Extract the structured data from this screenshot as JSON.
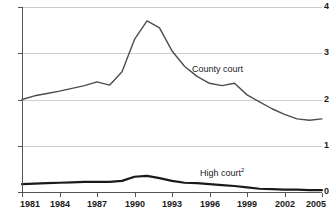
{
  "chart_data": {
    "type": "line",
    "title": "",
    "subtitle": "",
    "xlabel": "",
    "ylabel": "",
    "xlim": [
      1981,
      2005
    ],
    "ylim": [
      0,
      4
    ],
    "grid": true,
    "legend_position": "inline-annotation",
    "y_ticks": [
      0,
      1,
      2,
      3,
      4
    ],
    "y_tick_labels": [
      "0",
      "1",
      "2",
      "3",
      "4"
    ],
    "x_ticks": [
      1981,
      1984,
      1987,
      1990,
      1993,
      1996,
      1999,
      2002,
      2005
    ],
    "x_tick_labels": [
      "1981",
      "1984",
      "1987",
      "1990",
      "1993",
      "1996",
      "1999",
      "2002",
      "2005"
    ],
    "x": [
      1981,
      1982,
      1983,
      1984,
      1985,
      1986,
      1987,
      1988,
      1989,
      1990,
      1991,
      1992,
      1993,
      1994,
      1995,
      1996,
      1997,
      1998,
      1999,
      2000,
      2001,
      2002,
      2003,
      2004,
      2005
    ],
    "series": [
      {
        "name": "County court",
        "label": "County court",
        "color": "#4d4d4d",
        "line_width": 1.4,
        "values": [
          2.0,
          2.08,
          2.13,
          2.18,
          2.24,
          2.3,
          2.38,
          2.31,
          2.6,
          3.3,
          3.7,
          3.55,
          3.05,
          2.72,
          2.5,
          2.35,
          2.3,
          2.35,
          2.1,
          1.95,
          1.8,
          1.68,
          1.58,
          1.55,
          1.58
        ]
      },
      {
        "name": "High court",
        "label": "High court",
        "label_superscript": "2",
        "color": "#1a1a1a",
        "line_width": 2.2,
        "values": [
          0.17,
          0.18,
          0.19,
          0.2,
          0.21,
          0.22,
          0.22,
          0.22,
          0.24,
          0.33,
          0.35,
          0.3,
          0.24,
          0.2,
          0.19,
          0.17,
          0.15,
          0.13,
          0.1,
          0.07,
          0.06,
          0.05,
          0.05,
          0.04,
          0.04
        ]
      }
    ],
    "annotations": [
      {
        "text": "County court",
        "x": 1997,
        "y": 2.75
      },
      {
        "text": "High court",
        "x": 1997,
        "y": 0.55
      }
    ],
    "colors": {
      "gridline": "#cfcfcf",
      "axis": "#555555",
      "text": "#1a1a1a",
      "background": "#ffffff"
    }
  }
}
